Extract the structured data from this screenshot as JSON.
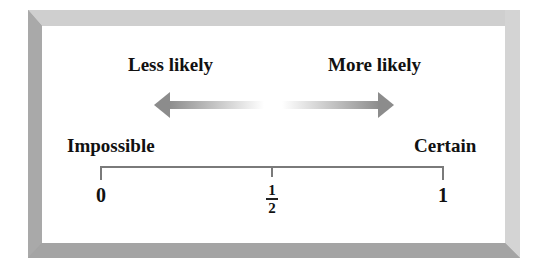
{
  "diagram": {
    "arrows": {
      "left": {
        "label": "Less likely",
        "direction": "left",
        "icon": "left-arrow-icon"
      },
      "right": {
        "label": "More likely",
        "direction": "right",
        "icon": "right-arrow-icon"
      }
    },
    "endpoints": {
      "left": "Impossible",
      "right": "Certain"
    },
    "ticks": [
      {
        "label": "0",
        "value": 0
      },
      {
        "numerator": "1",
        "denominator": "2",
        "value": 0.5
      },
      {
        "label": "1",
        "value": 1
      }
    ],
    "colors": {
      "arrow": "#8c8c8c",
      "frame_top": "#cfcfcf",
      "frame_left": "#a9a9a9",
      "frame_bottom": "#a4a4a4",
      "frame_right": "#d4d4d4",
      "line": "#7a7a7a",
      "text": "#111111"
    }
  }
}
